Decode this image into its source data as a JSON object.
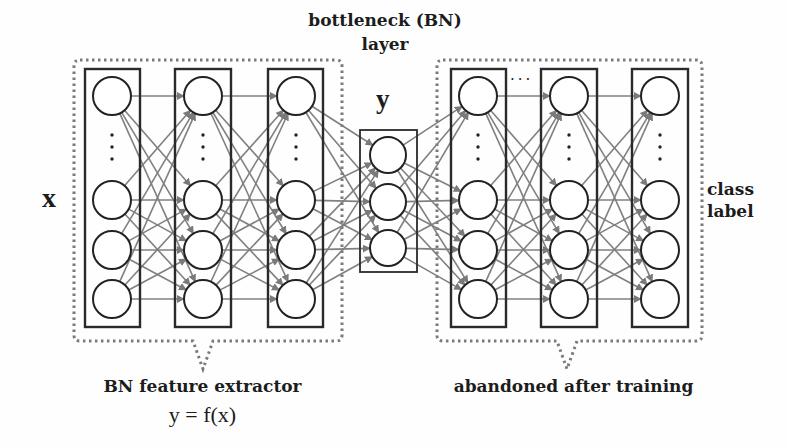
{
  "labels": {
    "bottleneck_line1": "bottleneck (BN)",
    "bottleneck_line2": "layer",
    "input": "x",
    "bottleneck_output": "y",
    "output_line1": "class",
    "output_line2": "label",
    "left_group": "BN feature extractor",
    "left_group_formula": "y = f(x)",
    "right_group": "abandoned after training",
    "skip_dots": "..."
  },
  "colors": {
    "box_stroke": "#2a2a2a",
    "node_stroke": "#222222",
    "edge": "#808080",
    "dotted_group": "#7a7a7a",
    "text": "#1c1c1c"
  },
  "layers": [
    {
      "name": "input-layer",
      "x": 112,
      "box": [
        85,
        69,
        55,
        258
      ],
      "nodes": [
        96,
        200,
        250,
        299
      ],
      "ellipsis": true
    },
    {
      "name": "hidden-layer-1",
      "x": 203,
      "box": [
        175,
        69,
        56,
        258
      ],
      "nodes": [
        96,
        200,
        250,
        299
      ],
      "ellipsis": true
    },
    {
      "name": "hidden-layer-2",
      "x": 296,
      "box": [
        268,
        69,
        55,
        258
      ],
      "nodes": [
        96,
        200,
        250,
        299
      ],
      "ellipsis": true
    },
    {
      "name": "bottleneck-layer",
      "x": 388,
      "box": [
        360,
        130,
        57,
        142
      ],
      "nodes": [
        155,
        202,
        248
      ],
      "ellipsis": false
    },
    {
      "name": "hidden-layer-3",
      "x": 478,
      "box": [
        451,
        69,
        55,
        258
      ],
      "nodes": [
        96,
        200,
        250,
        299
      ],
      "ellipsis": true
    },
    {
      "name": "hidden-layer-4",
      "x": 569,
      "box": [
        541,
        69,
        56,
        258
      ],
      "nodes": [
        96,
        200,
        250,
        299
      ],
      "ellipsis": true
    },
    {
      "name": "output-layer",
      "x": 660,
      "box": [
        632,
        69,
        56,
        258
      ],
      "nodes": [
        96,
        200,
        250,
        299
      ],
      "ellipsis": true
    }
  ],
  "groups": [
    {
      "name": "bn-feature-extractor-group",
      "rect": [
        74,
        60,
        268,
        281
      ],
      "notch_x": 203,
      "notch_tip_y": 369
    },
    {
      "name": "abandoned-after-training-group",
      "rect": [
        437,
        60,
        265,
        281
      ],
      "notch_x": 567,
      "notch_tip_y": 369
    }
  ]
}
